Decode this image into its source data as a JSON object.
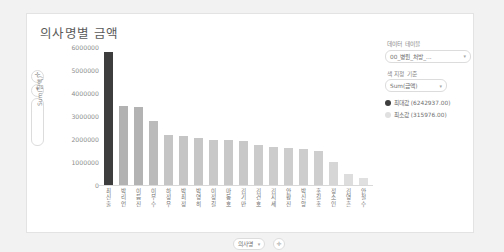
{
  "card": {
    "title": "의사명별 금액"
  },
  "left_controls": {
    "zoom_in": "✛",
    "zoom_out": "▾",
    "axis_label": "Sum(금액)"
  },
  "x_footer": {
    "field_pill": "의사명",
    "field_caret": "▾",
    "add_button": "✛"
  },
  "panel": {
    "data_table_label": "데이터 테이블",
    "data_table_value": "00_병원_처방_...",
    "color_by_label": "색 지정 기준",
    "color_by_value": "Sum(금액)",
    "caret": "▾",
    "legend": [
      {
        "label": "최대값 (6242937.00)",
        "color": "#3d3d3d"
      },
      {
        "label": "최소값 (315976.00)",
        "color": "#e0e0e0"
      }
    ]
  },
  "chart_data": {
    "type": "bar",
    "title": "의사명별 금액",
    "xlabel": "의사명",
    "ylabel": "Sum(금액)",
    "ylim": [
      0,
      6500000
    ],
    "yticks": [
      6000000,
      5000000,
      4000000,
      3000000,
      2000000,
      1000000,
      0
    ],
    "ytick_labels": [
      "6000000",
      "5000000",
      "4000000",
      "3000000",
      "2000000",
      "1000000",
      "0"
    ],
    "grid": false,
    "legend_position": "right",
    "max_value": 6242937.0,
    "min_value": 315976.0,
    "categories": [
      "최신출",
      "박리언",
      "이듬진",
      "이무수",
      "하정우",
      "박최정",
      "박영히",
      "이정길",
      "마동호",
      "김기만",
      "김건호",
      "김지세",
      "안황진",
      "박신앙",
      "홍길홍",
      "정소인",
      "김영흔",
      "안철수"
    ],
    "values": [
      6242937,
      3700000,
      3680000,
      3030000,
      2340000,
      2290000,
      2230000,
      2130000,
      2100000,
      2060000,
      1900000,
      1800000,
      1750000,
      1700000,
      1620000,
      1090000,
      520000,
      315976
    ]
  }
}
